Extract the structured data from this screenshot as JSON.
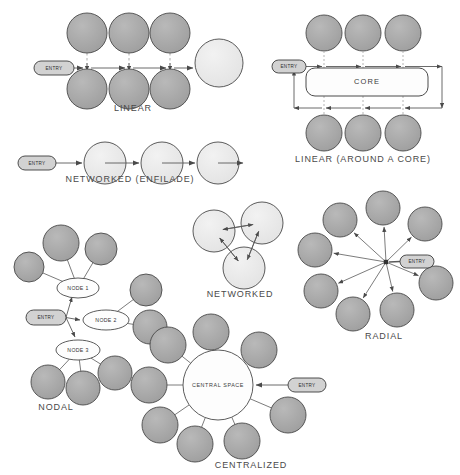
{
  "diagram": {
    "background_color": "#ffffff",
    "palette": {
      "node_fill": "#a8a8a8",
      "node_stroke": "#4a4a4a",
      "light_fill": "#e8e8e8",
      "white_fill": "#fdfdfd",
      "entry_fill": "#d2d2d2",
      "entry_stroke": "#3c3c3c",
      "line": "#5a5a5a",
      "label_color": "#4a4a4a",
      "dashed": "#b5b5b5"
    },
    "entry_label": "ENTRY",
    "panels": [
      {
        "id": "linear",
        "label": "LINEAR",
        "label_pos": {
          "x": 133,
          "y": 109
        },
        "entry": {
          "x": 34,
          "y": 61,
          "w": 40,
          "h": 14
        },
        "nodes": [
          {
            "x": 87,
            "y": 33,
            "r": 20,
            "tone": "node"
          },
          {
            "x": 129,
            "y": 33,
            "r": 20,
            "tone": "node"
          },
          {
            "x": 170,
            "y": 33,
            "r": 20,
            "tone": "node"
          },
          {
            "x": 87,
            "y": 89,
            "r": 20,
            "tone": "node"
          },
          {
            "x": 129,
            "y": 89,
            "r": 20,
            "tone": "node"
          },
          {
            "x": 170,
            "y": 89,
            "r": 20,
            "tone": "node"
          },
          {
            "x": 219,
            "y": 63,
            "r": 24,
            "tone": "light"
          }
        ]
      },
      {
        "id": "linear-core",
        "label": "LINEAR (AROUND A CORE)",
        "label_pos": {
          "x": 363,
          "y": 160
        },
        "entry": {
          "x": 272,
          "y": 60,
          "w": 34,
          "h": 13
        },
        "core": {
          "x": 306,
          "y": 68,
          "w": 122,
          "h": 28,
          "label": "CORE"
        },
        "nodes": [
          {
            "x": 324,
            "y": 33,
            "r": 18,
            "tone": "node"
          },
          {
            "x": 363,
            "y": 33,
            "r": 18,
            "tone": "node"
          },
          {
            "x": 403,
            "y": 33,
            "r": 18,
            "tone": "node"
          },
          {
            "x": 324,
            "y": 133,
            "r": 18,
            "tone": "node"
          },
          {
            "x": 363,
            "y": 133,
            "r": 18,
            "tone": "node"
          },
          {
            "x": 403,
            "y": 133,
            "r": 18,
            "tone": "node"
          }
        ]
      },
      {
        "id": "networked-enfilade",
        "label": "NETWORKED (ENFILADE)",
        "label_pos": {
          "x": 130,
          "y": 180
        },
        "entry": {
          "x": 18,
          "y": 156,
          "w": 38,
          "h": 14
        },
        "nodes": [
          {
            "x": 105,
            "y": 163,
            "r": 21,
            "tone": "light"
          },
          {
            "x": 162,
            "y": 163,
            "r": 21,
            "tone": "light"
          },
          {
            "x": 218,
            "y": 163,
            "r": 21,
            "tone": "light"
          }
        ]
      },
      {
        "id": "nodal",
        "label": "NODAL",
        "label_pos": {
          "x": 56,
          "y": 408
        },
        "entry": {
          "x": 26,
          "y": 310,
          "w": 40,
          "h": 15
        },
        "hubs": [
          {
            "label": "NODE 1",
            "x": 78,
            "y": 288,
            "rx": 21,
            "ry": 10
          },
          {
            "label": "NODE 2",
            "x": 106,
            "y": 320,
            "rx": 23,
            "ry": 10
          },
          {
            "label": "NODE 3",
            "x": 78,
            "y": 350,
            "rx": 22,
            "ry": 10
          }
        ],
        "nodes": [
          {
            "x": 29,
            "y": 267,
            "r": 15,
            "tone": "node"
          },
          {
            "x": 61,
            "y": 243,
            "r": 18,
            "tone": "node"
          },
          {
            "x": 101,
            "y": 249,
            "r": 16,
            "tone": "node"
          },
          {
            "x": 146,
            "y": 290,
            "r": 16,
            "tone": "node"
          },
          {
            "x": 150,
            "y": 327,
            "r": 17,
            "tone": "node"
          },
          {
            "x": 48,
            "y": 382,
            "r": 17,
            "tone": "node"
          },
          {
            "x": 83,
            "y": 388,
            "r": 17,
            "tone": "node"
          },
          {
            "x": 115,
            "y": 373,
            "r": 17,
            "tone": "node"
          }
        ]
      },
      {
        "id": "networked",
        "label": "NETWORKED",
        "label_pos": {
          "x": 240,
          "y": 295
        },
        "nodes": [
          {
            "x": 214,
            "y": 231,
            "r": 21,
            "tone": "light"
          },
          {
            "x": 262,
            "y": 223,
            "r": 21,
            "tone": "light"
          },
          {
            "x": 244,
            "y": 268,
            "r": 21,
            "tone": "light"
          }
        ]
      },
      {
        "id": "radial",
        "label": "RADIAL",
        "label_pos": {
          "x": 384,
          "y": 337
        },
        "center": {
          "x": 386,
          "y": 262
        },
        "entry": {
          "x": 400,
          "y": 255,
          "w": 34,
          "h": 13
        },
        "nodes": [
          {
            "x": 340,
            "y": 220,
            "r": 17,
            "tone": "node"
          },
          {
            "x": 383,
            "y": 208,
            "r": 17,
            "tone": "node"
          },
          {
            "x": 425,
            "y": 224,
            "r": 17,
            "tone": "node"
          },
          {
            "x": 315,
            "y": 250,
            "r": 17,
            "tone": "node"
          },
          {
            "x": 436,
            "y": 283,
            "r": 17,
            "tone": "node"
          },
          {
            "x": 321,
            "y": 291,
            "r": 17,
            "tone": "node"
          },
          {
            "x": 353,
            "y": 314,
            "r": 17,
            "tone": "node"
          },
          {
            "x": 397,
            "y": 310,
            "r": 17,
            "tone": "node"
          }
        ]
      },
      {
        "id": "centralized",
        "label": "CENTRALIZED",
        "label_pos": {
          "x": 251,
          "y": 466
        },
        "entry": {
          "x": 288,
          "y": 378,
          "w": 38,
          "h": 14
        },
        "center": {
          "x": 218,
          "y": 385,
          "r": 35,
          "label": "CENTRAL SPACE"
        },
        "nodes": [
          {
            "x": 211,
            "y": 332,
            "r": 18,
            "tone": "node"
          },
          {
            "x": 168,
            "y": 345,
            "r": 18,
            "tone": "node"
          },
          {
            "x": 259,
            "y": 350,
            "r": 18,
            "tone": "node"
          },
          {
            "x": 149,
            "y": 385,
            "r": 18,
            "tone": "node"
          },
          {
            "x": 288,
            "y": 415,
            "r": 18,
            "tone": "node"
          },
          {
            "x": 160,
            "y": 425,
            "r": 18,
            "tone": "node"
          },
          {
            "x": 195,
            "y": 444,
            "r": 18,
            "tone": "node"
          },
          {
            "x": 242,
            "y": 441,
            "r": 18,
            "tone": "node"
          }
        ]
      }
    ]
  }
}
